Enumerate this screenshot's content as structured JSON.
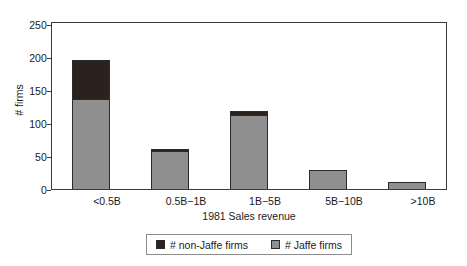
{
  "chart_data": {
    "type": "bar",
    "subtype": "stacked-vertical",
    "title": "",
    "xlabel": "1981 Sales revenue",
    "ylabel": "# firms",
    "categories": [
      "<0.5B",
      "0.5B−1B",
      "1B−5B",
      "5B−10B",
      ">10B"
    ],
    "series": [
      {
        "name": "# Jaffe firms",
        "color": "#8f8f8f",
        "values": [
          135,
          57,
          111,
          28,
          10
        ]
      },
      {
        "name": "# non-Jaffe firms",
        "color": "#2b211d",
        "values": [
          60,
          4,
          6,
          0,
          0
        ]
      }
    ],
    "totals": [
      195,
      61,
      117,
      28,
      10
    ],
    "ylim": [
      0,
      250
    ],
    "yticks": [
      0,
      50,
      100,
      150,
      200,
      250
    ],
    "ytick_labels": [
      "0",
      "50",
      "100",
      "150",
      "200",
      "250"
    ],
    "grid": false,
    "legend_position": "bottom-center",
    "stack_order": [
      "# Jaffe firms",
      "# non-Jaffe firms"
    ]
  },
  "axes": {
    "y_title": "# firms",
    "x_title": "1981 Sales revenue",
    "y_tick_labels": [
      "250",
      "200",
      "150",
      "100",
      "50",
      "0"
    ],
    "x_tick_labels": [
      "<0.5B",
      "0.5B−1B",
      "1B−5B",
      "5B−10B",
      ">10B"
    ]
  },
  "legend": {
    "entries": [
      {
        "label": "# non-Jaffe firms",
        "color": "#2b211d"
      },
      {
        "label": "# Jaffe firms",
        "color": "#8f8f8f"
      }
    ]
  },
  "colors": {
    "jaffe": "#8f8f8f",
    "non_jaffe": "#2b211d",
    "axis": "#3b3b3b",
    "bar_outline": "#2b2b2b",
    "legend_border": "#8d8d8d",
    "background": "#ffffff",
    "text": "#1a1a1a"
  }
}
